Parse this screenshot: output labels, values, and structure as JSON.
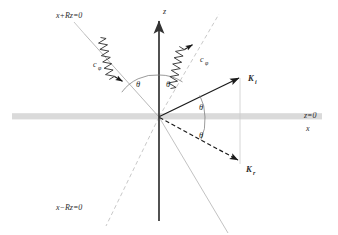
{
  "figure": {
    "type": "physics-schematic",
    "background_color": "#ffffff",
    "interface_color": "#d8d8d8",
    "axis_color": "#333333",
    "ray_color": "#9a9a9a",
    "vector_color": "#1a1a1a"
  },
  "labels": {
    "z_axis": "z",
    "x_axis": "x",
    "interface": "z=0",
    "line_upper_left": "x+Rz=0",
    "line_lower_left": "x−Rz=0",
    "phonon_left": "c",
    "phonon_left_sub": "φ",
    "phonon_right": "c",
    "phonon_right_sub": "φ",
    "vector_incident": "K",
    "vector_incident_sub": "i",
    "vector_reflected": "K",
    "vector_reflected_sub": "r",
    "angle_1": "θ",
    "angle_2": "θ",
    "angle_3": "θ",
    "angle_4": "θ"
  },
  "geometry": {
    "origin_x": 159,
    "origin_y": 117,
    "interface_y": 117,
    "interface_x_start": 12,
    "interface_x_end": 322,
    "z_axis_top": 18,
    "z_axis_bottom": 221,
    "incident_angle_deg": 28,
    "reflected_angle_deg": 28,
    "phonon_angle_left_deg": 62,
    "phonon_angle_right_deg": 62
  }
}
